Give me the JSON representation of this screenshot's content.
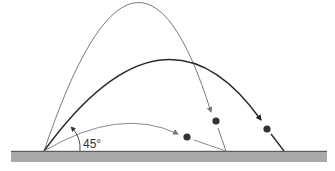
{
  "diagram": {
    "type": "projectile-trajectories",
    "angle_label": "45°",
    "colors": {
      "ground_fill": "#a9a9a9",
      "ground_edge": "#4a4a4a",
      "steep_arc": "#777777",
      "optimal_arc": "#2a2a2a",
      "shallow_arc": "#888888",
      "ball": "#333333"
    },
    "trajectories": [
      {
        "name": "steep",
        "launch": [
          44,
          151
        ],
        "peak": [
          137,
          13
        ],
        "landing": [
          226,
          151
        ]
      },
      {
        "name": "optimal-45",
        "launch": [
          44,
          151
        ],
        "peak": [
          165,
          68
        ],
        "landing": [
          284,
          151
        ]
      },
      {
        "name": "shallow",
        "launch": [
          44,
          151
        ],
        "peak": [
          120,
          128
        ],
        "landing": [
          226,
          151
        ]
      }
    ]
  }
}
